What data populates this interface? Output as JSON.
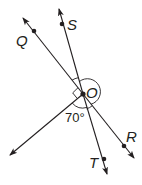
{
  "diagram": {
    "type": "geometry-rays",
    "center": {
      "label": "O"
    },
    "points": [
      {
        "label": "Q"
      },
      {
        "label": "S"
      },
      {
        "label": "R"
      },
      {
        "label": "T"
      }
    ],
    "angle_label": "70°",
    "colors": {
      "ink": "#231f20",
      "background": "#ffffff"
    }
  }
}
